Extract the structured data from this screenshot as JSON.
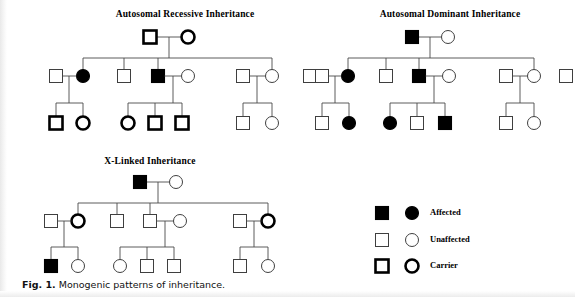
{
  "figure": {
    "caption_lead": "Fig. 1.",
    "caption_text": "Monogenic patterns of inheritance."
  },
  "pedigrees": [
    {
      "id": "autosomal-recessive",
      "title": "Autosomal Recessive Inheritance",
      "title_x": 185,
      "title_y": 17,
      "generation1": {
        "father": {
          "shape": "square",
          "status": "carrier",
          "x": 150,
          "y": 37
        },
        "mother": {
          "shape": "circle",
          "status": "carrier",
          "x": 188,
          "y": 37
        },
        "mating_y": 37,
        "drop_x": 169,
        "sib_bar_y": 58
      },
      "generation2": [
        {
          "shape": "square",
          "status": "unaffected",
          "x": 56,
          "y": 76
        },
        {
          "shape": "circle",
          "status": "affected",
          "x": 83,
          "y": 76
        },
        {
          "shape": "square",
          "status": "unaffected",
          "x": 124,
          "y": 76
        },
        {
          "shape": "square",
          "status": "affected",
          "x": 158,
          "y": 76
        },
        {
          "shape": "circle",
          "status": "unaffected",
          "x": 188,
          "y": 76
        },
        {
          "shape": "square",
          "status": "unaffected",
          "x": 243,
          "y": 76
        },
        {
          "shape": "circle",
          "status": "unaffected",
          "x": 272,
          "y": 76
        },
        {
          "shape": "square",
          "status": "unaffected",
          "x": 310,
          "y": 76
        }
      ],
      "sib_drops": [
        83,
        124,
        158,
        272
      ],
      "generation3": [
        {
          "shape": "square",
          "status": "carrier",
          "x": 56,
          "y": 123
        },
        {
          "shape": "circle",
          "status": "carrier",
          "x": 83,
          "y": 123
        },
        {
          "shape": "circle",
          "status": "carrier",
          "x": 128,
          "y": 123
        },
        {
          "shape": "square",
          "status": "carrier",
          "x": 155,
          "y": 123
        },
        {
          "shape": "square",
          "status": "carrier",
          "x": 182,
          "y": 123
        },
        {
          "shape": "square",
          "status": "unaffected",
          "x": 243,
          "y": 123
        },
        {
          "shape": "circle",
          "status": "unaffected",
          "x": 272,
          "y": 123
        }
      ],
      "families": [
        {
          "mate_x1": 56,
          "mate_x2": 83,
          "mate_y": 76,
          "drop_x": 69,
          "bar_y": 103,
          "children_x": [
            56,
            83
          ]
        },
        {
          "mate_x1": 158,
          "mate_x2": 188,
          "mate_y": 76,
          "drop_x": 173,
          "bar_y": 103,
          "children_x": [
            128,
            155,
            182
          ]
        },
        {
          "mate_x1": 243,
          "mate_x2": 272,
          "mate_y": 76,
          "drop_x": 257,
          "bar_y": 103,
          "children_x": [
            243,
            272
          ]
        }
      ]
    },
    {
      "id": "autosomal-dominant",
      "title": "Autosomal Dominant Inheritance",
      "title_x": 450,
      "title_y": 17,
      "generation1": {
        "father": {
          "shape": "square",
          "status": "affected",
          "x": 412,
          "y": 37
        },
        "mother": {
          "shape": "circle",
          "status": "unaffected",
          "x": 448,
          "y": 37
        },
        "mating_y": 37,
        "drop_x": 430,
        "sib_bar_y": 58
      },
      "generation2": [
        {
          "shape": "square",
          "status": "unaffected",
          "x": 322,
          "y": 76
        },
        {
          "shape": "circle",
          "status": "affected",
          "x": 348,
          "y": 76
        },
        {
          "shape": "square",
          "status": "unaffected",
          "x": 386,
          "y": 76
        },
        {
          "shape": "square",
          "status": "affected",
          "x": 419,
          "y": 76
        },
        {
          "shape": "circle",
          "status": "unaffected",
          "x": 449,
          "y": 76
        },
        {
          "shape": "square",
          "status": "unaffected",
          "x": 506,
          "y": 76
        },
        {
          "shape": "circle",
          "status": "unaffected",
          "x": 534,
          "y": 76
        },
        {
          "shape": "square",
          "status": "unaffected",
          "x": 566,
          "y": 76
        }
      ],
      "sib_drops": [
        348,
        386,
        419,
        534
      ],
      "generation3": [
        {
          "shape": "square",
          "status": "unaffected",
          "x": 322,
          "y": 123
        },
        {
          "shape": "circle",
          "status": "affected",
          "x": 349,
          "y": 123
        },
        {
          "shape": "circle",
          "status": "affected",
          "x": 390,
          "y": 123
        },
        {
          "shape": "square",
          "status": "unaffected",
          "x": 417,
          "y": 123
        },
        {
          "shape": "square",
          "status": "affected",
          "x": 445,
          "y": 123
        },
        {
          "shape": "square",
          "status": "unaffected",
          "x": 506,
          "y": 123
        },
        {
          "shape": "circle",
          "status": "unaffected",
          "x": 534,
          "y": 123
        }
      ],
      "families": [
        {
          "mate_x1": 322,
          "mate_x2": 348,
          "mate_y": 76,
          "drop_x": 335,
          "bar_y": 103,
          "children_x": [
            322,
            349
          ]
        },
        {
          "mate_x1": 419,
          "mate_x2": 449,
          "mate_y": 76,
          "drop_x": 434,
          "bar_y": 103,
          "children_x": [
            390,
            417,
            445
          ]
        },
        {
          "mate_x1": 506,
          "mate_x2": 534,
          "mate_y": 76,
          "drop_x": 520,
          "bar_y": 103,
          "children_x": [
            506,
            534
          ]
        }
      ]
    },
    {
      "id": "x-linked",
      "title": "X-Linked Inheritance",
      "title_x": 150,
      "title_y": 164,
      "generation1": {
        "father": {
          "shape": "square",
          "status": "affected",
          "x": 140,
          "y": 182
        },
        "mother": {
          "shape": "circle",
          "status": "unaffected",
          "x": 176,
          "y": 182
        },
        "mating_y": 182,
        "drop_x": 158,
        "sib_bar_y": 203
      },
      "generation2": [
        {
          "shape": "square",
          "status": "unaffected",
          "x": 51,
          "y": 221
        },
        {
          "shape": "circle",
          "status": "carrier",
          "x": 78,
          "y": 221
        },
        {
          "shape": "square",
          "status": "unaffected",
          "x": 117,
          "y": 221
        },
        {
          "shape": "square",
          "status": "unaffected",
          "x": 150,
          "y": 221
        },
        {
          "shape": "circle",
          "status": "unaffected",
          "x": 180,
          "y": 221
        },
        {
          "shape": "square",
          "status": "unaffected",
          "x": 240,
          "y": 221
        },
        {
          "shape": "circle",
          "status": "carrier",
          "x": 268,
          "y": 221
        }
      ],
      "sib_drops": [
        78,
        117,
        150,
        268
      ],
      "generation3": [
        {
          "shape": "square",
          "status": "affected",
          "x": 51,
          "y": 266
        },
        {
          "shape": "circle",
          "status": "unaffected",
          "x": 78,
          "y": 266
        },
        {
          "shape": "circle",
          "status": "unaffected",
          "x": 120,
          "y": 266
        },
        {
          "shape": "square",
          "status": "unaffected",
          "x": 147,
          "y": 266
        },
        {
          "shape": "square",
          "status": "unaffected",
          "x": 174,
          "y": 266
        },
        {
          "shape": "square",
          "status": "unaffected",
          "x": 240,
          "y": 266
        },
        {
          "shape": "circle",
          "status": "unaffected",
          "x": 268,
          "y": 266
        }
      ],
      "families": [
        {
          "mate_x1": 51,
          "mate_x2": 78,
          "mate_y": 221,
          "drop_x": 64,
          "bar_y": 247,
          "children_x": [
            51,
            78
          ]
        },
        {
          "mate_x1": 150,
          "mate_x2": 180,
          "mate_y": 221,
          "drop_x": 165,
          "bar_y": 247,
          "children_x": [
            120,
            147,
            174
          ]
        },
        {
          "mate_x1": 240,
          "mate_x2": 268,
          "mate_y": 221,
          "drop_x": 254,
          "bar_y": 247,
          "children_x": [
            240,
            268
          ]
        }
      ]
    }
  ],
  "legend": {
    "x_square": 382,
    "x_circle": 412,
    "x_label": 430,
    "rows": [
      {
        "label": "Affected",
        "status": "affected",
        "y": 213
      },
      {
        "label": "Unaffected",
        "status": "unaffected",
        "y": 240
      },
      {
        "label": "Carrier",
        "status": "carrier",
        "y": 266
      }
    ]
  },
  "symbol_size": {
    "square": 13,
    "circle_r": 6.5
  }
}
